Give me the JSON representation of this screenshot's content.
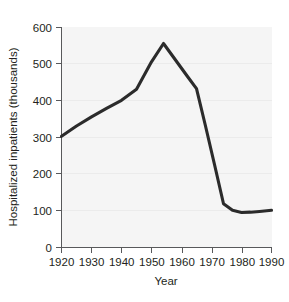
{
  "chart_data": {
    "type": "line",
    "title": "",
    "xlabel": "Year",
    "ylabel": "Hospitalized inpatients (thousands)",
    "xlim": [
      1920,
      1990
    ],
    "ylim": [
      0,
      600
    ],
    "grid": true,
    "legend": "none",
    "x_ticks": [
      1920,
      1930,
      1940,
      1950,
      1960,
      1970,
      1980,
      1990
    ],
    "x_tick_labels": [
      "1920",
      "1930",
      "1940",
      "1950",
      "1960",
      "1970",
      "1980",
      "1990"
    ],
    "y_ticks": [
      0,
      100,
      200,
      300,
      400,
      500,
      600
    ],
    "y_tick_labels": [
      "0",
      "100",
      "200",
      "300",
      "400",
      "500",
      "600"
    ],
    "series": [
      {
        "name": "Hospitalized inpatients",
        "color": "#2b2b2b",
        "x": [
          1920,
          1925,
          1930,
          1935,
          1940,
          1945,
          1950,
          1954,
          1958,
          1962,
          1965,
          1968,
          1971,
          1974,
          1977,
          1980,
          1983,
          1986,
          1990
        ],
        "values": [
          302,
          330,
          355,
          378,
          400,
          430,
          505,
          555,
          510,
          465,
          432,
          330,
          225,
          118,
          100,
          94,
          95,
          97,
          100
        ]
      }
    ]
  },
  "axes": {
    "x_axis_name": "Year",
    "y_axis_name": "Hospitalized inpatients (thousands)"
  }
}
